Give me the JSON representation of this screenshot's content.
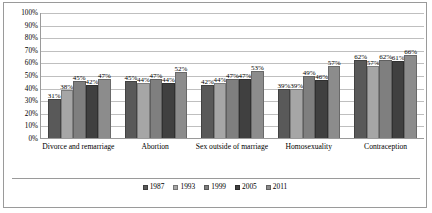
{
  "chart_data": {
    "type": "bar",
    "title": "",
    "xlabel": "",
    "ylabel": "",
    "ylim": [
      0,
      100
    ],
    "ytick_labels": [
      "100%",
      "90%",
      "80%",
      "70%",
      "60%",
      "50%",
      "40%",
      "30%",
      "20%",
      "10%",
      "0%"
    ],
    "yticks": [
      100,
      90,
      80,
      70,
      60,
      50,
      40,
      30,
      20,
      10,
      0
    ],
    "grid": true,
    "legend_position": "bottom",
    "categories": [
      "Divorce and remarriage",
      "Abortion",
      "Sex outside of marriage",
      "Homosexuality",
      "Contraception"
    ],
    "series": [
      {
        "name": "1987",
        "color": "#595959",
        "values": [
          31,
          45,
          42,
          39,
          62
        ],
        "labels": [
          "31%",
          "45%",
          "42%",
          "39%",
          "62%"
        ]
      },
      {
        "name": "1993",
        "color": "#a6a6a6",
        "values": [
          38,
          44,
          44,
          39,
          57
        ],
        "labels": [
          "38%",
          "44%",
          "44%",
          "39%",
          "57%"
        ]
      },
      {
        "name": "1999",
        "color": "#7f7f7f",
        "values": [
          45,
          47,
          47,
          49,
          62
        ],
        "labels": [
          "45%",
          "47%",
          "47%",
          "49%",
          "62%"
        ]
      },
      {
        "name": "2005",
        "color": "#404040",
        "values": [
          42,
          44,
          47,
          46,
          61
        ],
        "labels": [
          "42%",
          "44%",
          "47%",
          "46%",
          "61%"
        ]
      },
      {
        "name": "2011",
        "color": "#8c8c8c",
        "values": [
          47,
          52,
          53,
          57,
          66
        ],
        "labels": [
          "47%",
          "52%",
          "53%",
          "57%",
          "66%"
        ]
      }
    ]
  }
}
